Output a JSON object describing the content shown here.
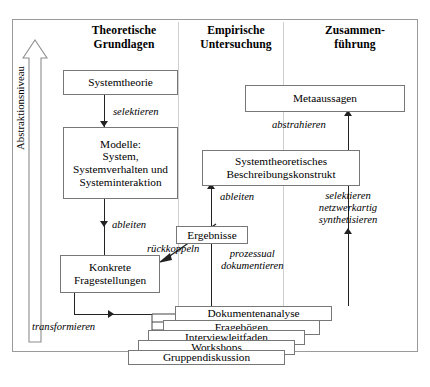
{
  "diagram": {
    "axis": {
      "label": "Abstraktionsniveau",
      "icon": "up-arrow-icon",
      "direction": "up"
    },
    "columns": [
      {
        "id": "col-theoretische-grundlagen",
        "lines": [
          "Theoretische",
          "Grundlagen"
        ]
      },
      {
        "id": "col-empirische-untersuchung",
        "lines": [
          "Empirische",
          "Untersuchung"
        ]
      },
      {
        "id": "col-zusammenfuehrung",
        "lines": [
          "Zusammen-",
          "führung"
        ]
      }
    ],
    "nodes": [
      {
        "id": "systemtheorie",
        "lines": [
          "Systemtheorie"
        ]
      },
      {
        "id": "modelle",
        "lines": [
          "Modelle:",
          "System,",
          "Systemverhalten und",
          "Systeminteraktion"
        ]
      },
      {
        "id": "konkrete-fragestellungen",
        "lines": [
          "Konkrete",
          "Fragestellungen"
        ]
      },
      {
        "id": "ergebnisse",
        "lines": [
          "Ergebnisse"
        ]
      },
      {
        "id": "systemtheoretisches-beschreibungskonstrukt",
        "lines": [
          "Systemtheoretisches",
          "Beschreibungskonstrukt"
        ]
      },
      {
        "id": "metaaussagen",
        "lines": [
          "Metaaussagen"
        ]
      },
      {
        "id": "dokumentenanalyse",
        "lines": [
          "Dokumentenanalyse"
        ]
      },
      {
        "id": "fragebogen",
        "lines": [
          "Fragebögen"
        ]
      },
      {
        "id": "interviewleitfaden",
        "lines": [
          "Interviewleitfaden"
        ]
      },
      {
        "id": "workshops",
        "lines": [
          "Workshops"
        ]
      },
      {
        "id": "gruppendiskussion",
        "lines": [
          "Gruppendiskussion"
        ]
      }
    ],
    "edges": [
      {
        "id": "edge-selektieren",
        "lines": [
          "selektieren"
        ],
        "from": "systemtheorie",
        "to": "modelle"
      },
      {
        "id": "edge-ableiten-left",
        "lines": [
          "ableiten"
        ],
        "from": "modelle",
        "to": "konkrete-fragestellungen"
      },
      {
        "id": "edge-transformieren",
        "lines": [
          "transformieren"
        ],
        "from": "konkrete-fragestellungen",
        "to": "methods"
      },
      {
        "id": "edge-rueckkoppeln",
        "lines": [
          "rückkoppeln"
        ],
        "from": "ergebnisse",
        "to": "konkrete-fragestellungen"
      },
      {
        "id": "edge-prozessual-dokumentieren",
        "lines": [
          "prozessual",
          "dokumentieren"
        ],
        "from": "methods",
        "to": "ergebnisse"
      },
      {
        "id": "edge-ableiten-right",
        "lines": [
          "ableiten"
        ],
        "from": "ergebnisse",
        "to": "systemtheoretisches-beschreibungskonstrukt"
      },
      {
        "id": "edge-abstrahieren",
        "lines": [
          "abstrahieren"
        ],
        "from": "systemtheoretisches-beschreibungskonstrukt",
        "to": "metaaussagen"
      },
      {
        "id": "edge-selektieren-netzwerkartig",
        "lines": [
          "selektieren",
          "netzwerkartig",
          "synthetisieren"
        ],
        "from": "methods",
        "to": "systemtheoretisches-beschreibungskonstrukt"
      }
    ],
    "colors": {
      "frame": "#9a9a9a",
      "box_border": "#777777",
      "connector": "#222222",
      "divider": "#cfcfcf",
      "background": "#ffffff"
    }
  }
}
